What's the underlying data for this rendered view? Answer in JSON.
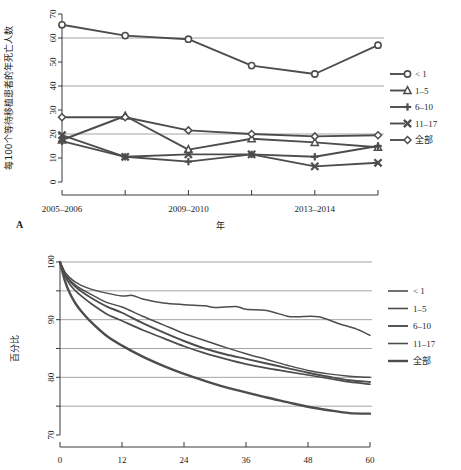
{
  "figure": {
    "panel_a_label": "A"
  },
  "chart_data": [
    {
      "id": "panel-a",
      "type": "line",
      "title": "",
      "panel_label": "A",
      "xlabel": "年",
      "ylabel": "每100个等待移植患者的年死亡人数",
      "categories": [
        "2005-2006",
        "2007-2008",
        "2009-2010",
        "2011-2012",
        "2013-2014",
        "2015-2016"
      ],
      "xtick_labels": [
        "2005–2006",
        "",
        "2009–2010",
        "",
        "2013–2014",
        ""
      ],
      "xtick_shown": [
        "2005–2006",
        "2009–2010",
        "2013–2014"
      ],
      "ytick_labels": [
        "0",
        "10",
        "20",
        "30",
        "40",
        "50",
        "60",
        "70"
      ],
      "ylim": [
        0,
        70
      ],
      "ytick_values": [
        0,
        10,
        20,
        30,
        40,
        50,
        60,
        70
      ],
      "gridlines_y": [
        20,
        40,
        60
      ],
      "grid": true,
      "legend_position": "right",
      "series": [
        {
          "name": "< 1",
          "marker": "circle",
          "values": [
            65.5,
            61.0,
            59.5,
            48.5,
            45.0,
            57.0
          ]
        },
        {
          "name": "1–5",
          "marker": "triangle",
          "values": [
            17.5,
            27.5,
            13.5,
            18.0,
            16.5,
            14.5
          ]
        },
        {
          "name": "6–10",
          "marker": "plus",
          "values": [
            17.0,
            10.5,
            8.5,
            11.5,
            10.5,
            15.0
          ]
        },
        {
          "name": "11–17",
          "marker": "cross",
          "values": [
            19.5,
            10.5,
            11.5,
            11.5,
            6.5,
            8.0
          ]
        },
        {
          "name": "全部",
          "marker": "diamond",
          "values": [
            27.0,
            27.0,
            21.5,
            20.0,
            19.0,
            19.5
          ]
        }
      ]
    },
    {
      "id": "panel-b",
      "type": "line",
      "title": "",
      "xlabel": "",
      "ylabel": "百分比",
      "x": [
        0,
        12,
        24,
        36,
        48,
        60
      ],
      "xtick_labels": [
        "0",
        "12",
        "24",
        "36",
        "48",
        "60"
      ],
      "ytick_labels": [
        "70",
        "80",
        "90",
        "100"
      ],
      "ylim": [
        70,
        100
      ],
      "ytick_values": [
        70,
        80,
        90,
        100
      ],
      "gridlines_y": [
        75,
        80,
        85,
        90,
        95,
        100
      ],
      "grid": true,
      "legend_position": "right",
      "xlim": [
        0,
        60
      ],
      "series": [
        {
          "name": "< 1",
          "values_x": [
            0,
            1,
            2,
            3,
            4,
            6,
            9,
            12,
            14,
            16,
            20,
            24,
            28,
            30,
            34,
            36,
            40,
            44,
            46,
            50,
            54,
            57,
            60
          ],
          "values_y": [
            100,
            98.2,
            97.2,
            96.5,
            96.0,
            95.3,
            94.6,
            94.1,
            94.2,
            93.6,
            92.9,
            92.6,
            92.4,
            92.1,
            92.3,
            91.8,
            91.6,
            90.6,
            90.5,
            90.5,
            89.3,
            88.5,
            87.3
          ]
        },
        {
          "name": "1–5",
          "values_x": [
            0,
            1,
            2,
            3,
            4,
            6,
            9,
            12,
            16,
            20,
            24,
            28,
            32,
            36,
            40,
            44,
            48,
            52,
            56,
            60
          ],
          "values_y": [
            100,
            98.0,
            96.8,
            96.0,
            95.4,
            94.4,
            93.0,
            92.2,
            90.6,
            89.1,
            87.6,
            86.4,
            85.2,
            84.1,
            83.1,
            82.1,
            81.2,
            80.6,
            80.2,
            80.0
          ]
        },
        {
          "name": "6–10",
          "values_x": [
            0,
            1,
            2,
            3,
            4,
            6,
            9,
            12,
            16,
            20,
            24,
            28,
            32,
            36,
            40,
            44,
            48,
            52,
            56,
            60
          ],
          "values_y": [
            100,
            97.8,
            96.6,
            95.7,
            95.0,
            93.8,
            92.3,
            91.2,
            89.4,
            87.8,
            86.3,
            85.0,
            84.0,
            83.2,
            82.4,
            81.6,
            80.8,
            80.1,
            79.5,
            79.2
          ]
        },
        {
          "name": "11–17",
          "values_x": [
            0,
            1,
            2,
            3,
            4,
            6,
            9,
            12,
            16,
            20,
            24,
            28,
            32,
            36,
            40,
            44,
            48,
            52,
            56,
            60
          ],
          "values_y": [
            100,
            97.5,
            96.0,
            95.0,
            94.2,
            92.8,
            91.0,
            89.8,
            88.2,
            86.8,
            85.4,
            84.2,
            83.2,
            82.3,
            81.6,
            81.0,
            80.4,
            79.8,
            79.2,
            78.8
          ]
        },
        {
          "name": "全部",
          "values_x": [
            0,
            1,
            2,
            3,
            4,
            6,
            9,
            12,
            16,
            20,
            24,
            28,
            32,
            36,
            40,
            44,
            48,
            52,
            56,
            60
          ],
          "values_y": [
            100,
            96.6,
            94.4,
            92.8,
            91.6,
            89.6,
            87.2,
            85.5,
            83.6,
            82.0,
            80.6,
            79.4,
            78.3,
            77.4,
            76.5,
            75.7,
            74.9,
            74.3,
            73.8,
            73.7
          ]
        }
      ]
    }
  ],
  "panel_a_legend": {
    "items": [
      {
        "label": "< 1",
        "marker": "circle"
      },
      {
        "label": "1–5",
        "marker": "triangle"
      },
      {
        "label": "6–10",
        "marker": "plus"
      },
      {
        "label": "11–17",
        "marker": "cross"
      },
      {
        "label": "全部",
        "marker": "diamond"
      }
    ]
  },
  "panel_b_legend": {
    "items": [
      {
        "label": "< 1"
      },
      {
        "label": "1–5"
      },
      {
        "label": "6–10"
      },
      {
        "label": "11–17"
      },
      {
        "label": "全部"
      }
    ]
  },
  "colors": {
    "line": "#4d4d4d",
    "axis": "#3a3a3a",
    "grid": "#8d8d8d",
    "text": "#1c1c1c"
  }
}
